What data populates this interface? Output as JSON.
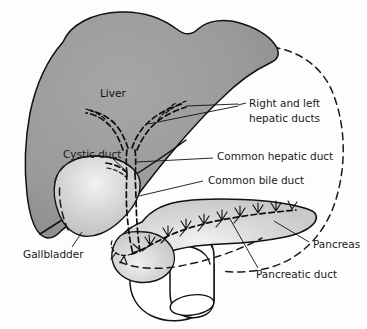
{
  "figure": {
    "background_color": "#fdfdfd"
  },
  "colors": {
    "liver_fill": "#9a9a9a",
    "liver_highlight": "#a8a8a8",
    "gallbladder_fill": "#cfcfcf",
    "gallbladder_highlight": "#eeeeee",
    "pancreas_fill": "#d2d2d2",
    "pancreas_highlight": "#f0f0f0",
    "duodenum_fill": "#ffffff",
    "outline": "#111111",
    "text": "#1a1a1a"
  },
  "organs": [
    {
      "name": "liver",
      "label": "Liver",
      "fill": "#9a9a9a"
    },
    {
      "name": "gallbladder",
      "label": "Gallbladder",
      "fill": "#cfcfcf"
    },
    {
      "name": "pancreas",
      "label": "Pancreas",
      "fill": "#d2d2d2"
    },
    {
      "name": "duodenum",
      "label": "",
      "fill": "#ffffff"
    }
  ],
  "labels": {
    "liver": "Liver",
    "hepatic_ducts_line1": "Right and left",
    "hepatic_ducts_line2": "hepatic ducts",
    "common_hepatic_duct": "Common hepatic duct",
    "common_bile_duct": "Common bile duct",
    "cystic_duct": "Cystic duct",
    "gallbladder": "Gallbladder",
    "pancreas": "Pancreas",
    "pancreatic_duct": "Pancreatic duct"
  }
}
